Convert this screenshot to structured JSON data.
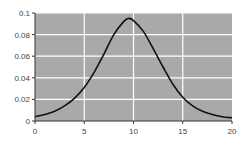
{
  "chart_data": {
    "type": "line",
    "title": "",
    "xlabel": "",
    "ylabel": "",
    "xlim": [
      0,
      20
    ],
    "ylim": [
      0,
      0.1
    ],
    "grid": true,
    "legend": null,
    "x_ticks": [
      "0",
      "5",
      "10",
      "15",
      "20"
    ],
    "y_ticks": [
      "0",
      "0.02",
      "0.04",
      "0.06",
      "0.08",
      "0.1"
    ],
    "series": [
      {
        "name": "density",
        "x": [
          0,
          1,
          2,
          3,
          4,
          5,
          6,
          7,
          8,
          9,
          9.5,
          10,
          11,
          12,
          13,
          14,
          15,
          16,
          17,
          18,
          19,
          20
        ],
        "values": [
          0.004,
          0.006,
          0.009,
          0.014,
          0.021,
          0.031,
          0.045,
          0.062,
          0.08,
          0.092,
          0.095,
          0.093,
          0.083,
          0.067,
          0.05,
          0.034,
          0.022,
          0.014,
          0.009,
          0.006,
          0.004,
          0.003
        ]
      }
    ],
    "colors": {
      "plot_background": "#a9a9a9",
      "gridline": "#ffffff",
      "line": "#111111",
      "axis": "#333333"
    }
  }
}
